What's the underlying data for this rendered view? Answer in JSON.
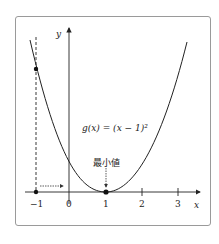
{
  "diagram": {
    "function_label": "g(x) = (x − 1)²",
    "function_label_parts": {
      "g": "g",
      "lhs": "(x) = (x − 1)",
      "exp": "2"
    },
    "min_annotation": "最小値",
    "x_axis_label": "x",
    "y_axis_label": "y",
    "x_ticks": [
      "−1",
      "0",
      "1",
      "2",
      "3"
    ],
    "marked_points": [
      {
        "x": -1,
        "y": 4,
        "note": "point on curve at x=-1"
      },
      {
        "x": -1,
        "y": 0,
        "note": "point on x-axis"
      },
      {
        "x": 1,
        "y": 0,
        "note": "minimum point"
      }
    ],
    "colors": {
      "curve": "#222222",
      "frame": "#9a9a9a",
      "background": "#ffffff"
    }
  }
}
